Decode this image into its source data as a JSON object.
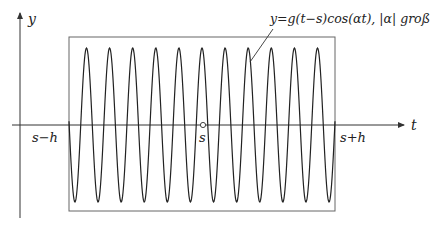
{
  "figure": {
    "axes": {
      "x_label": "t",
      "y_label": "y"
    },
    "ticks": {
      "left": "s−h",
      "center": "s",
      "right": "s+h"
    },
    "annotation": {
      "curve_label": "y=g(t−s)cos(αt),  |α| groß"
    },
    "curve": {
      "description": "windowed cosine, high frequency",
      "peaks_count": 11,
      "period_px": 23.1,
      "color": "#222222"
    },
    "window_box": {
      "color": "#555555"
    }
  }
}
